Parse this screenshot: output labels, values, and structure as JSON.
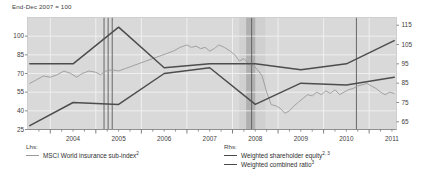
{
  "caption": "End-Dec 2007 = 100",
  "legend": {
    "lhs_header": "Lhs:",
    "rhs_header": "Rhs:",
    "items": [
      {
        "label": "MSCI World insurance sub-index",
        "sup": "2",
        "color": "#9a9a9a",
        "side": "lhs",
        "name": "legend-msci-world-insurance-sub-index"
      },
      {
        "label": "Weighted shareholder equity",
        "sup": "2, 3",
        "color": "#4a4a4a",
        "side": "rhs",
        "name": "legend-weighted-shareholder-equity"
      },
      {
        "label": "Weighted combined ratio",
        "sup": "3",
        "color": "#4a4a4a",
        "side": "rhs",
        "name": "legend-weighted-combined-ratio"
      }
    ]
  },
  "colors": {
    "plot_background": "#d9d9d9",
    "band_light": "#d0d0d0",
    "band_dark": "#b0b0b0",
    "gridline": "#f2f2f2",
    "msci_line": "#9a9a9a",
    "equity_line": "#4d4d4d",
    "combined_ratio_line": "#4d4d4d",
    "event_line": "#5a5a5a",
    "text": "#404040"
  },
  "chart_data": {
    "type": "line",
    "title": "",
    "subtitle": "End-Dec 2007 = 100",
    "xlabel": "",
    "ylabel": "",
    "grid": true,
    "legend_position": "bottom",
    "x": [
      2003.5,
      2011.6
    ],
    "xlim": [
      2003.5,
      2011.6
    ],
    "xticks_major": [
      2004,
      2005,
      2006,
      2007,
      2008,
      2009,
      2010,
      2011
    ],
    "xtick_labels": [
      "2004",
      "2005",
      "2006",
      "2007",
      "2008",
      "2009",
      "2010",
      "2011"
    ],
    "left_axis": {
      "label": "Lhs",
      "ylim": [
        25,
        115
      ],
      "ticks": [
        25,
        40,
        55,
        70,
        85,
        100
      ],
      "tick_labels": [
        "25",
        "40",
        "55",
        "70",
        "85",
        "100"
      ]
    },
    "right_axis": {
      "label": "Rhs",
      "ylim": [
        61,
        119
      ],
      "ticks": [
        65,
        75,
        85,
        95,
        105,
        115
      ],
      "tick_labels": [
        "65",
        "75",
        "85",
        "95",
        "105",
        "115"
      ]
    },
    "shaded_bands": [
      {
        "name": "light-band-2008",
        "x0": 2008.15,
        "x1": 2008.72,
        "color": "#d0d0d0"
      },
      {
        "name": "dark-band-2008",
        "x0": 2008.3,
        "x1": 2008.5,
        "color": "#b0b0b0"
      }
    ],
    "event_lines": [
      {
        "name": "event-line-2005a",
        "x": 2005.18
      },
      {
        "name": "event-line-2005b",
        "x": 2005.27
      },
      {
        "name": "event-line-2005c",
        "x": 2005.36
      },
      {
        "name": "event-line-2008",
        "x": 2008.42
      },
      {
        "name": "event-line-2010",
        "x": 2010.72
      }
    ],
    "series": [
      {
        "name": "MSCI World insurance sub-index",
        "axis": "left",
        "color": "#9a9a9a",
        "points": [
          [
            2003.55,
            62
          ],
          [
            2003.7,
            65
          ],
          [
            2003.85,
            68
          ],
          [
            2004.0,
            67
          ],
          [
            2004.15,
            69
          ],
          [
            2004.3,
            72
          ],
          [
            2004.45,
            70
          ],
          [
            2004.58,
            67
          ],
          [
            2004.7,
            70
          ],
          [
            2004.85,
            72
          ],
          [
            2005.0,
            71
          ],
          [
            2005.1,
            69
          ],
          [
            2005.22,
            72
          ],
          [
            2005.35,
            73
          ],
          [
            2005.5,
            72
          ],
          [
            2005.65,
            74
          ],
          [
            2005.8,
            76
          ],
          [
            2005.95,
            78
          ],
          [
            2006.1,
            80
          ],
          [
            2006.25,
            82
          ],
          [
            2006.4,
            84
          ],
          [
            2006.55,
            86
          ],
          [
            2006.7,
            88
          ],
          [
            2006.85,
            91
          ],
          [
            2007.0,
            93
          ],
          [
            2007.1,
            91
          ],
          [
            2007.2,
            92
          ],
          [
            2007.3,
            90
          ],
          [
            2007.4,
            91
          ],
          [
            2007.5,
            88
          ],
          [
            2007.6,
            90
          ],
          [
            2007.7,
            93
          ],
          [
            2007.82,
            91
          ],
          [
            2007.95,
            88
          ],
          [
            2008.05,
            85
          ],
          [
            2008.15,
            80
          ],
          [
            2008.25,
            82
          ],
          [
            2008.35,
            78
          ],
          [
            2008.45,
            77
          ],
          [
            2008.55,
            73
          ],
          [
            2008.65,
            68
          ],
          [
            2008.75,
            55
          ],
          [
            2008.85,
            45
          ],
          [
            2008.95,
            44
          ],
          [
            2009.05,
            42
          ],
          [
            2009.15,
            38
          ],
          [
            2009.25,
            40
          ],
          [
            2009.35,
            44
          ],
          [
            2009.45,
            47
          ],
          [
            2009.55,
            50
          ],
          [
            2009.65,
            53
          ],
          [
            2009.75,
            52
          ],
          [
            2009.85,
            55
          ],
          [
            2009.95,
            53
          ],
          [
            2010.05,
            56
          ],
          [
            2010.15,
            54
          ],
          [
            2010.25,
            57
          ],
          [
            2010.35,
            53
          ],
          [
            2010.45,
            55
          ],
          [
            2010.55,
            57
          ],
          [
            2010.65,
            58
          ],
          [
            2010.75,
            60
          ],
          [
            2010.85,
            61
          ],
          [
            2010.95,
            62
          ],
          [
            2011.05,
            60
          ],
          [
            2011.15,
            58
          ],
          [
            2011.25,
            55
          ],
          [
            2011.35,
            53
          ],
          [
            2011.45,
            55
          ],
          [
            2011.55,
            54
          ]
        ]
      },
      {
        "name": "Weighted shareholder equity",
        "axis": "right",
        "color": "#4d4d4d",
        "points": [
          [
            2003.55,
            63
          ],
          [
            2004.5,
            75
          ],
          [
            2005.5,
            74
          ],
          [
            2006.5,
            90
          ],
          [
            2007.5,
            93
          ],
          [
            2008.5,
            74
          ],
          [
            2009.5,
            85
          ],
          [
            2010.5,
            84
          ],
          [
            2011.55,
            88
          ]
        ]
      },
      {
        "name": "Weighted combined ratio",
        "axis": "right",
        "color": "#4d4d4d",
        "points": [
          [
            2003.55,
            95
          ],
          [
            2004.5,
            95
          ],
          [
            2005.5,
            114
          ],
          [
            2006.5,
            93
          ],
          [
            2007.5,
            95
          ],
          [
            2008.5,
            95
          ],
          [
            2009.5,
            92
          ],
          [
            2010.5,
            95
          ],
          [
            2011.55,
            107
          ]
        ]
      }
    ]
  }
}
